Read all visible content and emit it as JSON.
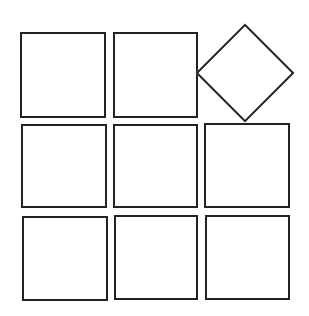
{
  "diagram": {
    "stroke_color": "#222222",
    "fill_color": "#ffffff",
    "background": "#ffffff",
    "grid": {
      "rows": 3,
      "cols": 3,
      "cells": [
        {
          "row": 0,
          "col": 0,
          "shape": "square",
          "x": 20,
          "y": 32,
          "w": 86,
          "h": 86
        },
        {
          "row": 0,
          "col": 1,
          "shape": "square",
          "x": 113,
          "y": 32,
          "w": 85,
          "h": 86
        },
        {
          "row": 0,
          "col": 2,
          "shape": "diamond",
          "cx": 245,
          "cy": 73,
          "half_diagonal": 49
        },
        {
          "row": 1,
          "col": 0,
          "shape": "square",
          "x": 21,
          "y": 124,
          "w": 86,
          "h": 84
        },
        {
          "row": 1,
          "col": 1,
          "shape": "square",
          "x": 113,
          "y": 124,
          "w": 85,
          "h": 84
        },
        {
          "row": 1,
          "col": 2,
          "shape": "square",
          "x": 204,
          "y": 123,
          "w": 86,
          "h": 85
        },
        {
          "row": 2,
          "col": 0,
          "shape": "square",
          "x": 22,
          "y": 216,
          "w": 86,
          "h": 85
        },
        {
          "row": 2,
          "col": 1,
          "shape": "square",
          "x": 114,
          "y": 215,
          "w": 84,
          "h": 85
        },
        {
          "row": 2,
          "col": 2,
          "shape": "square",
          "x": 205,
          "y": 215,
          "w": 85,
          "h": 85
        }
      ]
    }
  }
}
